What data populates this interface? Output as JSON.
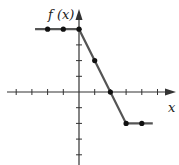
{
  "chart_data": {
    "type": "line",
    "title": "",
    "xlabel": "x",
    "ylabel": "f (x)",
    "grid": false,
    "xlim": [
      -5,
      6
    ],
    "ylim": [
      -4,
      5
    ],
    "series": [
      {
        "name": "f(x)",
        "x": [
          -2.8,
          0,
          3,
          4.7
        ],
        "y": [
          4,
          4,
          -2,
          -2
        ],
        "markers": {
          "x": [
            -2,
            -1,
            0,
            1,
            2,
            3,
            4
          ],
          "y": [
            4,
            4,
            4,
            2,
            0,
            -2,
            -2
          ]
        }
      }
    ]
  },
  "labels": {
    "y_axis": "f (x)",
    "x_axis": "x"
  },
  "colors": {
    "line": "#555555",
    "axis": "#333333",
    "marker": "#111111"
  }
}
